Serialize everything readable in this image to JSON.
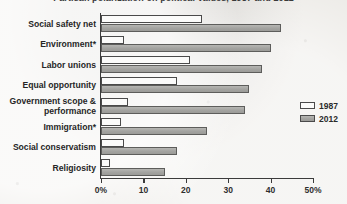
{
  "chart_data": {
    "type": "bar",
    "orientation": "horizontal",
    "title": "Partisan polarization on political values, 1987 and 2012",
    "xlabel": "",
    "ylabel": "",
    "xlim": [
      0,
      50
    ],
    "xticks": [
      "0%",
      "10",
      "20",
      "30",
      "40",
      "50%"
    ],
    "xtick_values": [
      0,
      10,
      20,
      30,
      40,
      50
    ],
    "grid": false,
    "legend_position": "right",
    "categories": [
      "Social safety net",
      "Environment*",
      "Labor unions",
      "Equal opportunity",
      "Government scope &\nperformance",
      "Immigration*",
      "Social conservatism",
      "Religiosity"
    ],
    "series": [
      {
        "name": "1987",
        "color": "#fbfbfa",
        "values": [
          23.8,
          5.4,
          21.0,
          18.0,
          6.4,
          4.7,
          5.4,
          2.1
        ]
      },
      {
        "name": "2012",
        "color": "#a9a9a6",
        "values": [
          42.5,
          40.0,
          38.0,
          35.0,
          34.0,
          25.0,
          18.0,
          15.0
        ]
      }
    ]
  },
  "legend": {
    "items": [
      {
        "label": "1987",
        "swatch": "y1987"
      },
      {
        "label": "2012",
        "swatch": "y2012"
      }
    ]
  }
}
